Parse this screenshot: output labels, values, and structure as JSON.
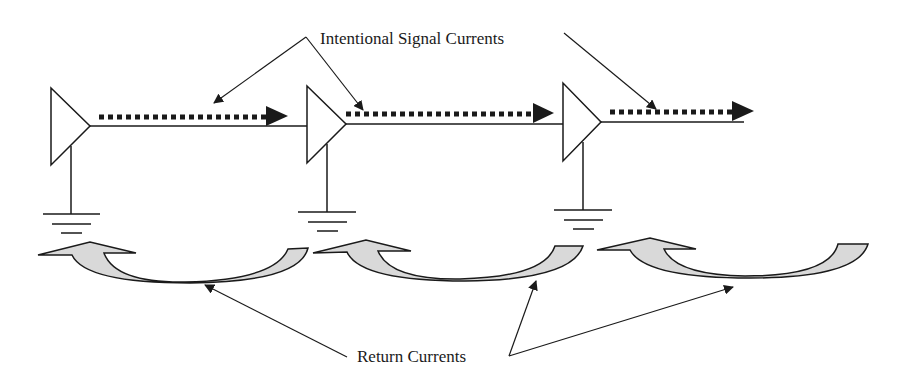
{
  "diagram": {
    "labels": {
      "signal": "Intentional Signal Currents",
      "return": "Return Currents"
    },
    "colors": {
      "stroke": "#1a1a1a",
      "arrow_fill": "#d9d9d9",
      "background": "#ffffff"
    },
    "stages": [
      {
        "id": 1,
        "buffer": "buffer-1",
        "ground": "ground-1"
      },
      {
        "id": 2,
        "buffer": "buffer-2",
        "ground": "ground-2"
      },
      {
        "id": 3,
        "buffer": "buffer-3",
        "ground": "ground-3"
      }
    ]
  }
}
